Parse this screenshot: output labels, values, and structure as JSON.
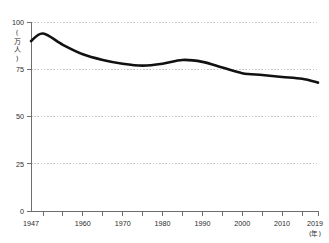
{
  "chart_data": {
    "type": "line",
    "title": "",
    "subtitle": "",
    "xlabel": "(年)",
    "ylabel": "(万人)",
    "ylabel_chars": [
      "(",
      "万",
      "人",
      ")"
    ],
    "xlim": [
      1947,
      2019
    ],
    "ylim": [
      0,
      100
    ],
    "grid": true,
    "grid_axis": "y",
    "legend": false,
    "legend_position": "none",
    "y_ticks": [
      0,
      25,
      50,
      75,
      100
    ],
    "y_tick_labels": [
      "0",
      "25",
      "50",
      "75",
      "100"
    ],
    "x_tick_labels": [
      "1947",
      "1960",
      "1970",
      "1980",
      "1990",
      "2000",
      "2010",
      "2019"
    ],
    "x_tick_label_values": [
      1947,
      1960,
      1970,
      1980,
      1990,
      2000,
      2010,
      2019
    ],
    "x_tick_marks": [
      1950,
      1955,
      1960,
      1965,
      1970,
      1975,
      1980,
      1985,
      1990,
      1995,
      2000,
      2005,
      2010,
      2015,
      2019
    ],
    "line_color": "#111111",
    "grid_color": "#b9b9b9",
    "axis_color": "#6e6e6e",
    "background_color": "#ffffff",
    "series": [
      {
        "name": "出生数",
        "x": [
          1947,
          1950,
          1955,
          1960,
          1965,
          1970,
          1975,
          1980,
          1985,
          1990,
          1995,
          2000,
          2005,
          2010,
          2015,
          2019
        ],
        "values": [
          90,
          94,
          88,
          83,
          80,
          78,
          77,
          78,
          80,
          79,
          76,
          73,
          72,
          71,
          70,
          68
        ]
      }
    ]
  },
  "axis": {
    "y_unit": "(万人)",
    "x_unit": "(年)"
  }
}
